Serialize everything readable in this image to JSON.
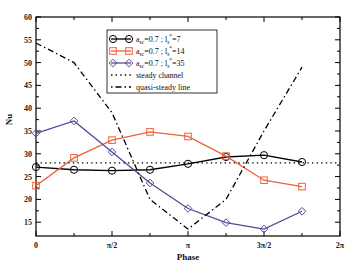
{
  "chart_data": {
    "type": "line",
    "title": "",
    "xlabel": "Phase",
    "ylabel": "Nu",
    "xlim": [
      0,
      6.2832
    ],
    "ylim": [
      12,
      60
    ],
    "x_tick_labels": [
      "0",
      "π/2",
      "π",
      "3π/2",
      "2π"
    ],
    "y_tick_labels": [
      "15",
      "20",
      "25",
      "30",
      "35",
      "40",
      "45",
      "50",
      "55",
      "60"
    ],
    "grid": false,
    "legend_position": "upper center",
    "x": [
      "0",
      "π/4",
      "π/2",
      "3π/4",
      "π",
      "5π/4",
      "3π/2",
      "7π/4"
    ],
    "series": [
      {
        "name": "a_sc=0.7 ; l_s*=7",
        "color": "#000000",
        "marker": "circle",
        "values": [
          27.1,
          26.5,
          26.3,
          26.5,
          27.8,
          29.3,
          29.7,
          28.2
        ]
      },
      {
        "name": "a_sc=0.7 ; l_s*=14",
        "color": "#f0603a",
        "marker": "square",
        "values": [
          23.0,
          29.1,
          33.0,
          34.8,
          33.8,
          29.5,
          24.2,
          22.8
        ]
      },
      {
        "name": "a_sc=0.7 ; l_s*=35",
        "color": "#4b4b9a",
        "marker": "diamond",
        "values": [
          34.5,
          37.2,
          30.4,
          23.6,
          18.0,
          14.9,
          13.5,
          17.4
        ]
      },
      {
        "name": "steady channel",
        "color": "#000000",
        "style": "dotted",
        "values": [
          28,
          28,
          28,
          28,
          28,
          28,
          28,
          28
        ]
      },
      {
        "name": "quasi-steady line",
        "color": "#000000",
        "style": "dash-dot",
        "values": [
          54.3,
          50.0,
          39.0,
          20.0,
          13.5,
          20.0,
          35.0,
          49.0
        ]
      }
    ]
  },
  "legend": {
    "items": [
      {
        "prefix": "a",
        "sub": "sc",
        "mid": "=0.7 ; l",
        "sub2": "s",
        "sup": "*",
        "suffix": "=7"
      },
      {
        "prefix": "a",
        "sub": "sc",
        "mid": "=0.7 ; l",
        "sub2": "s",
        "sup": "*",
        "suffix": "=14"
      },
      {
        "prefix": "a",
        "sub": "sc",
        "mid": "=0.7 ; l",
        "sub2": "s",
        "sup": "*",
        "suffix": "=35"
      },
      {
        "label": "steady channel"
      },
      {
        "label": "quasi-steady line"
      }
    ]
  }
}
